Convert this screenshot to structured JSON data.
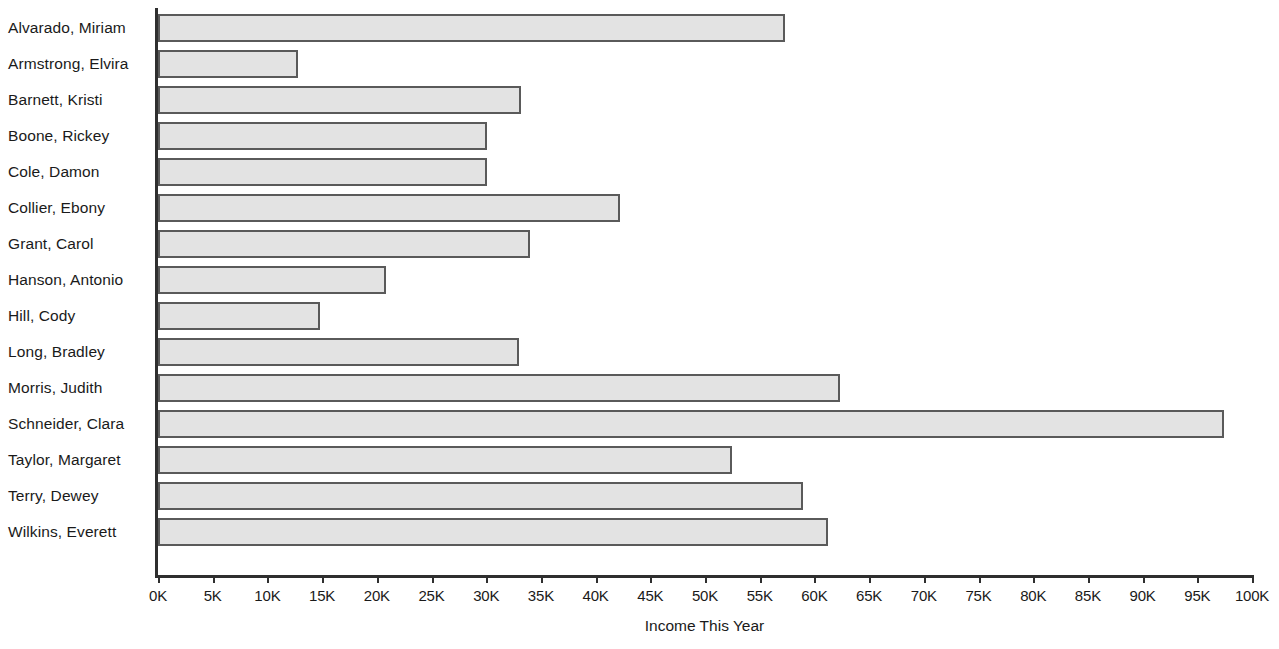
{
  "chart_data": {
    "type": "bar",
    "orientation": "horizontal",
    "title": "",
    "xlabel": "Income This Year",
    "ylabel": "",
    "xlim": [
      0,
      100000
    ],
    "grid": false,
    "legend": null,
    "tick_labels": [
      "0K",
      "5K",
      "10K",
      "15K",
      "20K",
      "25K",
      "30K",
      "35K",
      "40K",
      "45K",
      "50K",
      "55K",
      "60K",
      "65K",
      "70K",
      "75K",
      "80K",
      "85K",
      "90K",
      "95K",
      "100K"
    ],
    "tick_values": [
      0,
      5000,
      10000,
      15000,
      20000,
      25000,
      30000,
      35000,
      40000,
      45000,
      50000,
      55000,
      60000,
      65000,
      70000,
      75000,
      80000,
      85000,
      90000,
      95000,
      100000
    ],
    "tick_step": 5000,
    "categories": [
      "Alvarado, Miriam",
      "Armstrong, Elvira",
      "Barnett, Kristi",
      "Boone, Rickey",
      "Cole, Damon",
      "Collier, Ebony",
      "Grant, Carol",
      "Hanson, Antonio",
      "Hill, Cody",
      "Long, Bradley",
      "Morris, Judith",
      "Schneider, Clara",
      "Taylor, Margaret",
      "Terry, Dewey",
      "Wilkins, Everett"
    ],
    "values": [
      57300,
      12800,
      33200,
      30100,
      30100,
      42200,
      34000,
      20800,
      14800,
      33000,
      62300,
      97400,
      52500,
      59000,
      61200
    ],
    "bar_fill_color": "#e3e3e3",
    "bar_edge_color": "#5a5a5a",
    "axis_color": "#2f2f2f",
    "text_color": "#1a1a1a",
    "background_color": "#ffffff"
  },
  "cropped_header": {
    "text": ""
  }
}
